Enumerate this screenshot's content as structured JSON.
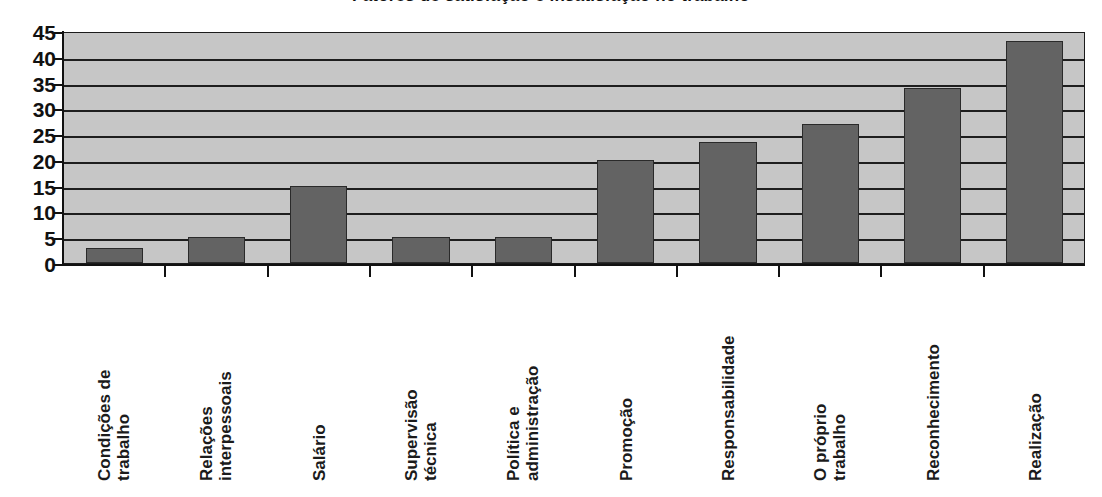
{
  "chart_data": {
    "type": "bar",
    "title": "Fatores de satisfação e insatisfação no trabalho",
    "xlabel": "",
    "ylabel": "",
    "ylim": [
      0,
      45
    ],
    "yticks": [
      0,
      5,
      10,
      15,
      20,
      25,
      30,
      35,
      40,
      45
    ],
    "grid": true,
    "legend": "none",
    "categories": [
      "Condições de trabalho",
      "Relações interpessoais",
      "Salário",
      "Supervisão técnica",
      "Política e administração",
      "Promoção",
      "Responsabilidade",
      "O próprio trabalho",
      "Reconhecimento",
      "Realização"
    ],
    "category_lines": [
      [
        "Condições de",
        "trabalho"
      ],
      [
        "Relações",
        "interpessoais"
      ],
      [
        "Salário"
      ],
      [
        "Supervisão",
        "técnica"
      ],
      [
        "Política e",
        "administração"
      ],
      [
        "Promoção"
      ],
      [
        "Responsabilidade"
      ],
      [
        "O próprio",
        "trabalho"
      ],
      [
        "Reconhecimento"
      ],
      [
        "Realização"
      ]
    ],
    "values": [
      3,
      5,
      15,
      5,
      5,
      20,
      23.5,
      27,
      34,
      43
    ]
  },
  "style": {
    "plot_background": "#c6c6c6",
    "bar_color": "#636363",
    "bar_border": "#2a2a2a",
    "gridline_color": "#1e1e1e",
    "axis_color": "#111111",
    "text_color": "#1b1b1b",
    "page_background": "#ffffff"
  }
}
